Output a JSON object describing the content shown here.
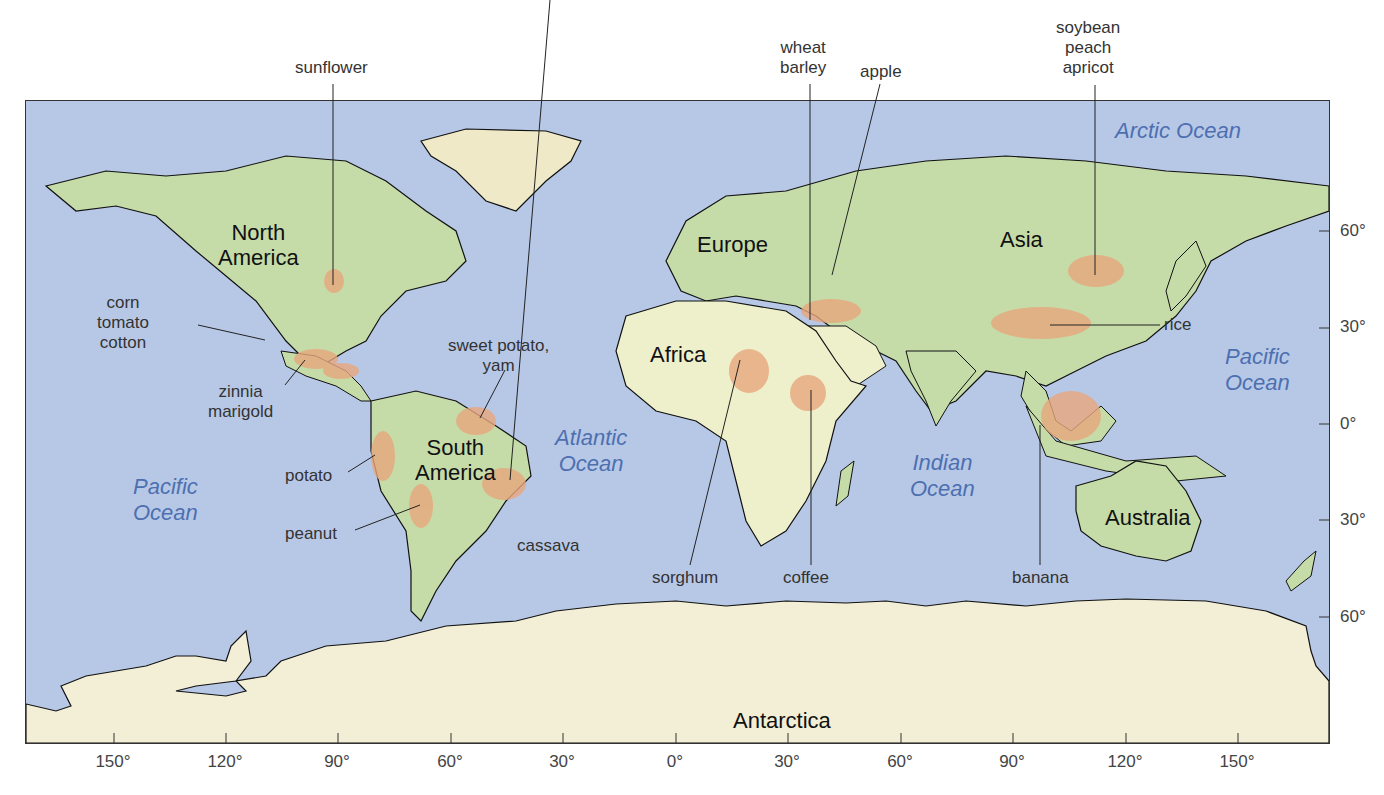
{
  "map": {
    "colors": {
      "ocean": "#b7c8e6",
      "land": "#c5dca8",
      "desert": "#eef0cc",
      "ice": "#f2efd6",
      "crop_region": "#e9a77e",
      "border": "#111111",
      "ocean_text": "#4d6fb0"
    },
    "continents": [
      {
        "name": "North America",
        "lines": [
          "North",
          "America"
        ]
      },
      {
        "name": "South America",
        "lines": [
          "South",
          "America"
        ]
      },
      {
        "name": "Europe",
        "lines": [
          "Europe"
        ]
      },
      {
        "name": "Africa",
        "lines": [
          "Africa"
        ]
      },
      {
        "name": "Asia",
        "lines": [
          "Asia"
        ]
      },
      {
        "name": "Australia",
        "lines": [
          "Australia"
        ]
      },
      {
        "name": "Antarctica",
        "lines": [
          "Antarctica"
        ]
      }
    ],
    "oceans": [
      {
        "name": "Arctic Ocean",
        "lines": [
          "Arctic Ocean"
        ]
      },
      {
        "name": "Pacific Ocean (west)",
        "lines": [
          "Pacific",
          "Ocean"
        ]
      },
      {
        "name": "Atlantic Ocean",
        "lines": [
          "Atlantic",
          "Ocean"
        ]
      },
      {
        "name": "Indian Ocean",
        "lines": [
          "Indian",
          "Ocean"
        ]
      },
      {
        "name": "Pacific Ocean (east)",
        "lines": [
          "Pacific",
          "Ocean"
        ]
      }
    ],
    "crops": [
      {
        "id": "sunflower",
        "lines": [
          "sunflower"
        ]
      },
      {
        "id": "corn",
        "lines": [
          "corn",
          "tomato",
          "cotton"
        ]
      },
      {
        "id": "zinnia",
        "lines": [
          "zinnia",
          "marigold"
        ]
      },
      {
        "id": "sweet-potato",
        "lines": [
          "sweet potato,",
          "yam"
        ]
      },
      {
        "id": "potato",
        "lines": [
          "potato"
        ]
      },
      {
        "id": "peanut",
        "lines": [
          "peanut"
        ]
      },
      {
        "id": "cassava",
        "lines": [
          "cassava"
        ]
      },
      {
        "id": "wheat",
        "lines": [
          "wheat",
          "barley"
        ]
      },
      {
        "id": "apple",
        "lines": [
          "apple"
        ]
      },
      {
        "id": "soybean",
        "lines": [
          "soybean",
          "peach",
          "apricot"
        ]
      },
      {
        "id": "rice",
        "lines": [
          "rice"
        ]
      },
      {
        "id": "sorghum",
        "lines": [
          "sorghum"
        ]
      },
      {
        "id": "coffee",
        "lines": [
          "coffee"
        ]
      },
      {
        "id": "banana",
        "lines": [
          "banana"
        ]
      }
    ],
    "longitude_ticks": [
      "150°",
      "120°",
      "90°",
      "60°",
      "30°",
      "0°",
      "30°",
      "60°",
      "90°",
      "120°",
      "150°"
    ],
    "latitude_ticks": [
      "60°",
      "30°",
      "0°",
      "30°",
      "60°"
    ]
  }
}
